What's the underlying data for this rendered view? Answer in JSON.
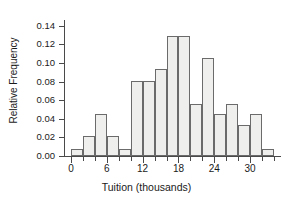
{
  "chart_data": {
    "type": "bar",
    "subtype": "histogram",
    "title": "",
    "xlabel": "Tuition (thousands)",
    "ylabel": "Relative Frequency",
    "xlim": [
      -1,
      35
    ],
    "ylim": [
      0.0,
      0.145
    ],
    "grid": false,
    "legend": null,
    "bin_width": 2,
    "bin_edges": [
      0,
      2,
      4,
      6,
      8,
      10,
      12,
      14,
      16,
      18,
      20,
      22,
      24,
      26,
      28,
      30,
      32,
      34
    ],
    "categories": [
      "0-2",
      "2-4",
      "4-6",
      "6-8",
      "8-10",
      "10-12",
      "12-14",
      "14-16",
      "16-18",
      "18-20",
      "20-22",
      "22-24",
      "24-26",
      "26-28",
      "28-30",
      "30-32",
      "32-34"
    ],
    "values": [
      0.008,
      0.021,
      0.045,
      0.021,
      0.008,
      0.081,
      0.081,
      0.093,
      0.129,
      0.129,
      0.056,
      0.105,
      0.045,
      0.056,
      0.033,
      0.045,
      0.008
    ],
    "yticks": [
      0.0,
      0.02,
      0.04,
      0.06,
      0.08,
      0.1,
      0.12,
      0.14
    ],
    "ytick_labels": [
      "0.00",
      "0.02",
      "0.04",
      "0.06",
      "0.08",
      "0.10",
      "0.12",
      "0.14"
    ],
    "xticks_major": [
      0,
      6,
      12,
      18,
      24,
      30
    ],
    "xtick_labels": [
      "0",
      "6",
      "12",
      "18",
      "24",
      "30"
    ],
    "xticks_minor": [
      2,
      4,
      8,
      10,
      14,
      16,
      20,
      22,
      26,
      28,
      32,
      34
    ],
    "bar_fill_color": "#efefee",
    "bar_edge_color": "#6b6b6b",
    "axis_color": "#4a4a4a",
    "background_color": "#ffffff"
  }
}
